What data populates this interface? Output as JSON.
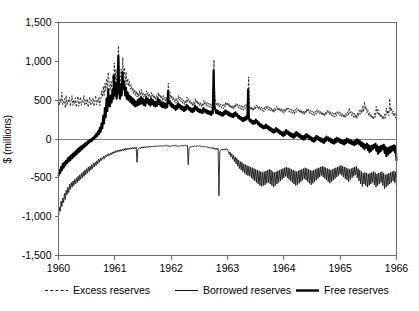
{
  "chart_data": {
    "type": "line",
    "title": "",
    "subtitle": "",
    "xlabel": "",
    "ylabel": "$ (millions)",
    "xlim": [
      1960.0,
      1966.0
    ],
    "ylim": [
      -1500,
      1500
    ],
    "grid": false,
    "legend_position": "bottom",
    "x_tick_labels": [
      "1960",
      "1961",
      "1962",
      "1963",
      "1964",
      "1965",
      "1966"
    ],
    "x_ticks": [
      1960,
      1961,
      1962,
      1963,
      1964,
      1965,
      1966
    ],
    "y_tick_labels": [
      "1,500",
      "1,000",
      "500",
      "0",
      "-500",
      "-1,000",
      "-1,500"
    ],
    "y_ticks": [
      1500,
      1000,
      500,
      0,
      -500,
      -1000,
      -1500
    ],
    "zero_line": 0,
    "sampling_note": "weekly observations, 1960-1966",
    "series": [
      {
        "name": "Excess reserves",
        "style": "dashed",
        "color": "#1a1a1a",
        "values": [
          560,
          430,
          520,
          470,
          600,
          440,
          480,
          520,
          400,
          560,
          430,
          500,
          470,
          540,
          420,
          490,
          560,
          430,
          500,
          450,
          530,
          410,
          480,
          550,
          420,
          490,
          540,
          430,
          500,
          470,
          560,
          430,
          500,
          450,
          520,
          410,
          470,
          540,
          430,
          500,
          460,
          530,
          420,
          490,
          560,
          440,
          510,
          470,
          540,
          430,
          500,
          620,
          540,
          680,
          560,
          720,
          620,
          780,
          650,
          860,
          700,
          620,
          740,
          660,
          820,
          700,
          980,
          760,
          900,
          700,
          820,
          1200,
          780,
          700,
          900,
          760,
          1050,
          820,
          920,
          740,
          860,
          700,
          780,
          680,
          740,
          640,
          700,
          620,
          660,
          580,
          640,
          560,
          620,
          540,
          600,
          540,
          620,
          560,
          640,
          560,
          600,
          540,
          580,
          520,
          620,
          560,
          600,
          540,
          580,
          520,
          600,
          540,
          580,
          520,
          560,
          500,
          560,
          520,
          600,
          540,
          580,
          520,
          560,
          500,
          560,
          500,
          540,
          480,
          540,
          500,
          720,
          560,
          600,
          520,
          560,
          500,
          540,
          480,
          520,
          460,
          520,
          480,
          560,
          500,
          540,
          480,
          520,
          460,
          500,
          440,
          500,
          460,
          540,
          480,
          520,
          460,
          500,
          440,
          480,
          420,
          480,
          440,
          520,
          460,
          500,
          440,
          480,
          420,
          470,
          420,
          460,
          420,
          500,
          440,
          480,
          430,
          470,
          420,
          460,
          410,
          450,
          400,
          460,
          420,
          1020,
          540,
          480,
          430,
          470,
          420,
          460,
          410,
          450,
          400,
          440,
          390,
          450,
          410,
          480,
          430,
          470,
          420,
          460,
          400,
          440,
          390,
          430,
          380,
          440,
          400,
          460,
          420,
          450,
          400,
          440,
          390,
          430,
          380,
          420,
          370,
          430,
          390,
          450,
          410,
          440,
          800,
          430,
          380,
          420,
          370,
          410,
          360,
          420,
          380,
          440,
          400,
          430,
          380,
          420,
          370,
          410,
          360,
          400,
          350,
          410,
          370,
          430,
          390,
          420,
          370,
          410,
          360,
          400,
          350,
          390,
          340,
          400,
          360,
          420,
          380,
          410,
          360,
          400,
          350,
          390,
          340,
          380,
          330,
          390,
          350,
          410,
          370,
          400,
          350,
          390,
          340,
          380,
          330,
          370,
          320,
          380,
          340,
          400,
          360,
          390,
          340,
          380,
          330,
          370,
          320,
          360,
          310,
          370,
          330,
          390,
          350,
          380,
          330,
          370,
          320,
          360,
          310,
          350,
          300,
          360,
          320,
          380,
          340,
          370,
          320,
          360,
          310,
          350,
          300,
          340,
          290,
          350,
          310,
          370,
          330,
          360,
          310,
          350,
          300,
          340,
          290,
          330,
          280,
          340,
          300,
          360,
          320,
          350,
          300,
          340,
          290,
          330,
          280,
          320,
          270,
          330,
          290,
          350,
          310,
          400,
          330,
          360,
          300,
          340,
          280,
          330,
          270,
          320,
          260,
          340,
          290,
          370,
          320,
          380,
          330,
          420,
          350,
          480,
          380,
          420,
          340,
          380,
          300,
          340,
          280,
          320,
          260,
          300,
          250,
          330,
          280,
          420,
          330,
          380,
          300,
          340,
          280,
          320,
          260,
          300,
          250,
          320,
          270,
          400,
          320,
          370,
          300,
          520,
          360,
          400,
          320,
          360,
          290,
          340,
          270,
          310
        ]
      },
      {
        "name": "Borrowed reserves",
        "style": "thin-solid",
        "color": "#111111",
        "values": [
          -1000,
          -880,
          -930,
          -800,
          -870,
          -760,
          -820,
          -700,
          -780,
          -660,
          -720,
          -620,
          -690,
          -580,
          -650,
          -560,
          -620,
          -540,
          -600,
          -520,
          -580,
          -500,
          -560,
          -480,
          -540,
          -460,
          -520,
          -440,
          -500,
          -420,
          -480,
          -400,
          -460,
          -380,
          -440,
          -360,
          -420,
          -350,
          -400,
          -330,
          -380,
          -310,
          -360,
          -300,
          -340,
          -280,
          -320,
          -260,
          -300,
          -250,
          -280,
          -240,
          -260,
          -220,
          -250,
          -210,
          -230,
          -200,
          -220,
          -190,
          -210,
          -180,
          -200,
          -170,
          -190,
          -160,
          -180,
          -150,
          -170,
          -145,
          -165,
          -140,
          -160,
          -135,
          -155,
          -130,
          -150,
          -125,
          -145,
          -120,
          -140,
          -118,
          -135,
          -115,
          -132,
          -112,
          -130,
          -110,
          -128,
          -108,
          -125,
          -106,
          -300,
          -130,
          -120,
          -110,
          -125,
          -105,
          -118,
          -100,
          -115,
          -98,
          -112,
          -96,
          -110,
          -95,
          -108,
          -94,
          -106,
          -92,
          -104,
          -90,
          -102,
          -88,
          -100,
          -86,
          -98,
          -85,
          -96,
          -84,
          -95,
          -83,
          -94,
          -82,
          -93,
          -81,
          -92,
          -80,
          -95,
          -85,
          -100,
          -88,
          -96,
          -84,
          -92,
          -82,
          -90,
          -80,
          -92,
          -84,
          -98,
          -88,
          -94,
          -84,
          -92,
          -82,
          -90,
          -80,
          -88,
          -78,
          -88,
          -80,
          -330,
          -120,
          -105,
          -95,
          -105,
          -90,
          -100,
          -88,
          -98,
          -86,
          -96,
          -85,
          -95,
          -84,
          -94,
          -90,
          -100,
          -92,
          -102,
          -94,
          -105,
          -96,
          -110,
          -100,
          -115,
          -105,
          -120,
          -108,
          -125,
          -110,
          -130,
          -115,
          -135,
          -118,
          -140,
          -120,
          -730,
          -160,
          -140,
          -130,
          -145,
          -128,
          -142,
          -126,
          -140,
          -124,
          -138,
          -160,
          -200,
          -170,
          -230,
          -190,
          -260,
          -210,
          -290,
          -230,
          -320,
          -250,
          -350,
          -270,
          -380,
          -290,
          -400,
          -300,
          -420,
          -320,
          -440,
          -330,
          -460,
          -340,
          -470,
          -350,
          -480,
          -360,
          -500,
          -370,
          -520,
          -380,
          -540,
          -390,
          -560,
          -400,
          -580,
          -410,
          -600,
          -420,
          -610,
          -430,
          -600,
          -420,
          -590,
          -410,
          -570,
          -400,
          -560,
          -390,
          -580,
          -400,
          -600,
          -420,
          -620,
          -430,
          -600,
          -420,
          -580,
          -410,
          -560,
          -400,
          -540,
          -390,
          -520,
          -380,
          -500,
          -370,
          -480,
          -360,
          -500,
          -370,
          -520,
          -380,
          -540,
          -390,
          -560,
          -400,
          -580,
          -410,
          -600,
          -420,
          -590,
          -410,
          -570,
          -400,
          -550,
          -390,
          -530,
          -380,
          -510,
          -370,
          -530,
          -380,
          -550,
          -390,
          -570,
          -400,
          -590,
          -410,
          -570,
          -400,
          -550,
          -390,
          -530,
          -380,
          -510,
          -370,
          -490,
          -360,
          -470,
          -350,
          -490,
          -360,
          -510,
          -370,
          -530,
          -380,
          -550,
          -390,
          -570,
          -400,
          -550,
          -390,
          -530,
          -380,
          -510,
          -370,
          -490,
          -360,
          -470,
          -350,
          -450,
          -340,
          -470,
          -350,
          -490,
          -360,
          -510,
          -370,
          -530,
          -380,
          -550,
          -390,
          -520,
          -380,
          -500,
          -370,
          -480,
          -360,
          -460,
          -350,
          -500,
          -380,
          -540,
          -400,
          -580,
          -420,
          -610,
          -440,
          -580,
          -430,
          -600,
          -440,
          -620,
          -450,
          -600,
          -440,
          -580,
          -430,
          -560,
          -420,
          -590,
          -430,
          -620,
          -450,
          -600,
          -440,
          -580,
          -430,
          -560,
          -420,
          -600,
          -440,
          -640,
          -460,
          -620,
          -450,
          -600,
          -440,
          -580,
          -430,
          -560,
          -420,
          -540,
          -410,
          -560,
          -430,
          -620
        ]
      },
      {
        "name": "Free reserves",
        "style": "thick-solid",
        "color": "#000000",
        "values": [
          -480,
          -400,
          -440,
          -360,
          -400,
          -320,
          -370,
          -300,
          -340,
          -280,
          -310,
          -250,
          -290,
          -230,
          -270,
          -210,
          -250,
          -190,
          -230,
          -170,
          -210,
          -150,
          -190,
          -130,
          -170,
          -110,
          -150,
          -95,
          -130,
          -80,
          -110,
          -60,
          -90,
          -45,
          -70,
          -30,
          -50,
          -15,
          -35,
          0,
          -20,
          20,
          0,
          40,
          20,
          70,
          40,
          100,
          60,
          140,
          90,
          200,
          140,
          300,
          200,
          400,
          280,
          520,
          360,
          640,
          450,
          420,
          560,
          470,
          640,
          520,
          820,
          560,
          720,
          520,
          640,
          1070,
          600,
          520,
          700,
          560,
          860,
          640,
          740,
          560,
          660,
          520,
          600,
          500,
          560,
          480,
          540,
          460,
          520,
          440,
          500,
          420,
          480,
          430,
          500,
          440,
          520,
          450,
          540,
          460,
          520,
          440,
          500,
          430,
          540,
          470,
          520,
          450,
          500,
          430,
          520,
          450,
          500,
          430,
          480,
          420,
          480,
          430,
          520,
          450,
          500,
          430,
          480,
          410,
          470,
          410,
          460,
          400,
          450,
          410,
          620,
          460,
          490,
          430,
          460,
          410,
          440,
          395,
          425,
          375,
          430,
          390,
          460,
          410,
          440,
          390,
          425,
          375,
          410,
          360,
          410,
          375,
          440,
          395,
          420,
          375,
          400,
          355,
          390,
          345,
          395,
          360,
          430,
          380,
          410,
          360,
          390,
          345,
          380,
          340,
          370,
          335,
          400,
          355,
          380,
          340,
          370,
          330,
          360,
          320,
          350,
          310,
          360,
          330,
          880,
          430,
          380,
          335,
          370,
          325,
          355,
          315,
          345,
          305,
          335,
          300,
          350,
          315,
          370,
          330,
          355,
          310,
          345,
          300,
          330,
          290,
          320,
          280,
          330,
          295,
          345,
          300,
          320,
          275,
          300,
          260,
          285,
          245,
          270,
          230,
          270,
          240,
          290,
          250,
          270,
          640,
          265,
          225,
          250,
          210,
          235,
          195,
          230,
          200,
          250,
          210,
          230,
          185,
          210,
          165,
          190,
          150,
          175,
          135,
          170,
          140,
          185,
          145,
          170,
          125,
          155,
          110,
          140,
          95,
          125,
          80,
          120,
          90,
          140,
          100,
          125,
          80,
          110,
          65,
          95,
          50,
          85,
          40,
          95,
          55,
          115,
          75,
          100,
          55,
          85,
          40,
          70,
          25,
          60,
          15,
          70,
          30,
          90,
          50,
          75,
          30,
          60,
          15,
          45,
          0,
          35,
          -10,
          45,
          5,
          65,
          25,
          50,
          5,
          35,
          -10,
          20,
          -25,
          10,
          -35,
          20,
          -20,
          40,
          0,
          30,
          -15,
          15,
          -30,
          5,
          -40,
          -5,
          -50,
          10,
          -30,
          30,
          -10,
          20,
          -25,
          5,
          -40,
          -5,
          -50,
          -15,
          -60,
          0,
          -45,
          15,
          -30,
          5,
          -40,
          -5,
          -50,
          -15,
          -60,
          -25,
          -70,
          -10,
          -55,
          5,
          -40,
          -5,
          -50,
          -15,
          -60,
          -25,
          -70,
          -35,
          -80,
          -20,
          -65,
          -5,
          -55,
          -15,
          -70,
          -30,
          -90,
          -45,
          -110,
          -60,
          -130,
          -75,
          -110,
          -60,
          -140,
          -80,
          -170,
          -95,
          -150,
          -85,
          -130,
          -75,
          -110,
          -60,
          -150,
          -85,
          -190,
          -105,
          -170,
          -95,
          -150,
          -85,
          -130,
          -75,
          -180,
          -100,
          -220,
          -120,
          -200,
          -110,
          -180,
          -100,
          -160,
          -90,
          -140,
          -80,
          -170,
          -95,
          -280
        ]
      }
    ]
  },
  "legend": {
    "items": [
      {
        "label": "Excess reserves",
        "style": "dashed"
      },
      {
        "label": "Borrowed reserves",
        "style": "thin-solid"
      },
      {
        "label": "Free reserves",
        "style": "thick-solid"
      }
    ]
  },
  "axes": {
    "y_title": "$ (millions)"
  }
}
